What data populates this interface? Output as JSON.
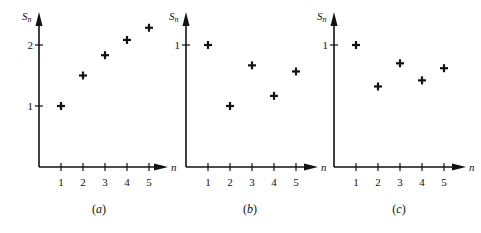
{
  "chart_data": [
    {
      "type": "scatter",
      "caption": "(a)",
      "caption_letter": "a",
      "title": "",
      "xlabel": "n",
      "ylabel": "S_n",
      "x": [
        1,
        2,
        3,
        4,
        5
      ],
      "values": [
        1.0,
        1.5,
        1.833,
        2.083,
        2.283
      ],
      "x_ticks": [
        "1",
        "2",
        "3",
        "4",
        "5"
      ],
      "y_ticks": [
        {
          "value": 1,
          "label": "1"
        },
        {
          "value": 2,
          "label": "2"
        }
      ],
      "ylim": [
        0,
        2.5
      ],
      "marker": "plus",
      "grid": false,
      "legend": null
    },
    {
      "type": "scatter",
      "caption": "(b)",
      "caption_letter": "b",
      "title": "",
      "xlabel": "n",
      "ylabel": "S_n",
      "x": [
        1,
        2,
        3,
        4,
        5
      ],
      "values": [
        1.0,
        0.5,
        0.833,
        0.583,
        0.783
      ],
      "x_ticks": [
        "1",
        "2",
        "3",
        "4",
        "5"
      ],
      "y_ticks": [
        {
          "value": 1,
          "label": "1"
        }
      ],
      "ylim": [
        0,
        1.25
      ],
      "marker": "plus",
      "grid": false,
      "legend": null
    },
    {
      "type": "scatter",
      "caption": "(c)",
      "caption_letter": "c",
      "title": "",
      "xlabel": "n",
      "ylabel": "S_n",
      "x": [
        1,
        2,
        3,
        4,
        5
      ],
      "values": [
        1.0,
        0.66,
        0.85,
        0.71,
        0.81
      ],
      "x_ticks": [
        "1",
        "2",
        "3",
        "4",
        "5"
      ],
      "y_ticks": [
        {
          "value": 1,
          "label": "1"
        }
      ],
      "ylim": [
        0,
        1.25
      ],
      "marker": "plus",
      "grid": false,
      "legend": null
    }
  ],
  "layout": {
    "panels": [
      {
        "origin_x": 39,
        "origin_y": 167,
        "x_step": 22,
        "px_per_unit": 61,
        "axis_end_x": 166,
        "axis_top_y": 14,
        "caption_x": 99
      },
      {
        "origin_x": 186,
        "origin_y": 167,
        "x_step": 22,
        "px_per_unit": 122,
        "axis_end_x": 316,
        "axis_top_y": 14,
        "caption_x": 250
      },
      {
        "origin_x": 334,
        "origin_y": 167,
        "x_step": 22,
        "px_per_unit": 122,
        "axis_end_x": 464,
        "axis_top_y": 14,
        "caption_x": 399
      }
    ],
    "ink_color": "#111111"
  }
}
